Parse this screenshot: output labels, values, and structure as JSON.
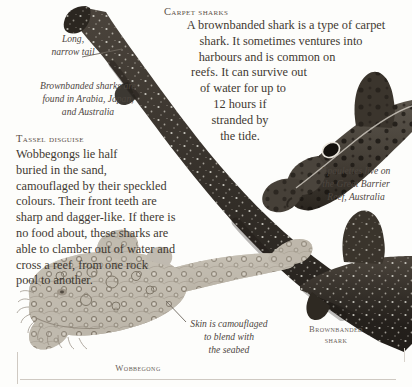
{
  "page": {
    "background": "#fdfdfb",
    "ink": "#3f3932",
    "width": 412,
    "height": 387
  },
  "carpet_sharks": {
    "heading": "Carpet sharks",
    "paragraph_lines": [
      "A brownbanded shark is a type of carpet",
      "shark. It sometimes ventures into",
      "harbours and is common on",
      "reefs. It can survive out",
      "of water for up to",
      "12 hours if",
      "stranded by",
      "the tide."
    ]
  },
  "tail_note": {
    "lines": [
      "Long,",
      "narrow tail"
    ]
  },
  "distribution_note": {
    "lines": [
      "Brownbanded sharks are",
      "found in Arabia, Japan,",
      "and Australia"
    ]
  },
  "tassel_disguise": {
    "heading": "Tassel disguise",
    "paragraph_lines": [
      "Wobbegongs lie half",
      "buried in the sand,",
      "camouflaged by their speckled",
      "colours. Their front teeth are",
      "sharp and dagger-like. If there is",
      "no food about, these sharks are",
      "able to clamber out of water and",
      "cross a reef, from one rock",
      "pool to another."
    ]
  },
  "epaulette_note": {
    "lines": [
      "Epaulettes live on",
      "the Great Barrier",
      "Reef, Australia"
    ]
  },
  "skin_note": {
    "lines": [
      "Skin is camouflaged",
      "to blend with",
      "the seabed"
    ]
  },
  "labels": {
    "wobbegong": "Wobbegong",
    "brownbanded_shark_line1": "Brownbanded",
    "brownbanded_shark_line2": "shark"
  },
  "illustration": {
    "brownbanded_body_color": "#3a342e",
    "brownbanded_spot_color": "#e8e4dc",
    "epaulette_body_color": "#4a443c",
    "epaulette_spot_color": "#1c1814",
    "wobbegong_body_color": "#b8b2a6",
    "wobbegong_pattern_color": "#8d8578"
  }
}
